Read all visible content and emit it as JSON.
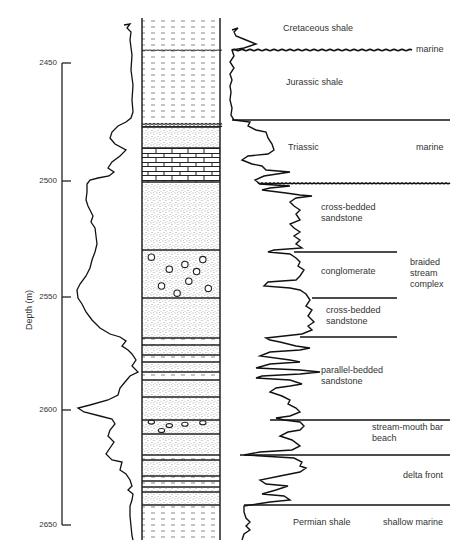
{
  "figure": {
    "axis": {
      "title": "Depth (m)",
      "ticks": [
        {
          "label": "2450",
          "y": 63
        },
        {
          "label": "2500",
          "y": 181
        },
        {
          "label": "2550",
          "y": 297
        },
        {
          "label": "2600",
          "y": 410
        },
        {
          "label": "2650",
          "y": 525
        }
      ]
    },
    "lithology_column": {
      "layers": [
        {
          "top": 18,
          "bottom": 50,
          "pattern": "shale"
        },
        {
          "top": 50,
          "bottom": 122,
          "pattern": "shale"
        },
        {
          "top": 122,
          "bottom": 127,
          "pattern": "wavy"
        },
        {
          "top": 127,
          "bottom": 148,
          "pattern": "sandstone"
        },
        {
          "top": 148,
          "bottom": 182,
          "pattern": "limestone"
        },
        {
          "top": 182,
          "bottom": 250,
          "pattern": "sandstone"
        },
        {
          "top": 250,
          "bottom": 298,
          "pattern": "conglomerate"
        },
        {
          "top": 298,
          "bottom": 338,
          "pattern": "sandstone"
        },
        {
          "top": 338,
          "bottom": 345,
          "pattern": "shale"
        },
        {
          "top": 345,
          "bottom": 355,
          "pattern": "sandstone"
        },
        {
          "top": 355,
          "bottom": 362,
          "pattern": "shale"
        },
        {
          "top": 362,
          "bottom": 372,
          "pattern": "sandstone"
        },
        {
          "top": 372,
          "bottom": 380,
          "pattern": "shale"
        },
        {
          "top": 380,
          "bottom": 397,
          "pattern": "sandstone"
        },
        {
          "top": 397,
          "bottom": 420,
          "pattern": "sandstone"
        },
        {
          "top": 420,
          "bottom": 434,
          "pattern": "conglomerate"
        },
        {
          "top": 434,
          "bottom": 455,
          "pattern": "sandstone"
        },
        {
          "top": 455,
          "bottom": 460,
          "pattern": "shale"
        },
        {
          "top": 460,
          "bottom": 476,
          "pattern": "sandstone"
        },
        {
          "top": 476,
          "bottom": 481,
          "pattern": "shale"
        },
        {
          "top": 481,
          "bottom": 487,
          "pattern": "shale"
        },
        {
          "top": 487,
          "bottom": 492,
          "pattern": "sandstone"
        },
        {
          "top": 492,
          "bottom": 505,
          "pattern": "sandstone"
        },
        {
          "top": 505,
          "bottom": 540,
          "pattern": "shale"
        }
      ]
    },
    "units": [
      {
        "name": "Cretaceous shale",
        "x": 283,
        "y": 28
      },
      {
        "name": "Jurassic shale",
        "x": 286,
        "y": 82
      },
      {
        "name": "Triassic",
        "x": 288,
        "y": 147
      },
      {
        "name": "cross-bedded sandstone",
        "x": 321,
        "y": 207,
        "lines": [
          "cross-bedded",
          "sandstone"
        ]
      },
      {
        "name": "conglomerate",
        "x": 321,
        "y": 271
      },
      {
        "name": "cross-bedded sandstone",
        "x": 326,
        "y": 310,
        "lines": [
          "cross-bedded",
          "sandstone"
        ]
      },
      {
        "name": "parallel-bedded sandstone",
        "x": 321,
        "y": 370,
        "lines": [
          "parallel-bedded",
          "sandstone"
        ]
      },
      {
        "name": "stream-mouth bar beach",
        "x": 372,
        "y": 427,
        "lines": [
          "stream-mouth bar",
          "beach"
        ]
      },
      {
        "name": "delta front",
        "x": 403,
        "y": 475
      },
      {
        "name": "Permian shale",
        "x": 293,
        "y": 522
      }
    ],
    "environments": [
      {
        "label": "marine",
        "x": 416,
        "y": 49
      },
      {
        "label": "marine",
        "x": 416,
        "y": 147
      },
      {
        "label": "braided stream complex",
        "x": 410,
        "y": 262,
        "lines": [
          "braided",
          "stream",
          "complex"
        ]
      },
      {
        "label": "shallow marine",
        "x": 383,
        "y": 522
      }
    ],
    "boundaries": [
      {
        "y": 50,
        "x1": 232,
        "x2": 410,
        "style": "wavy"
      },
      {
        "y": 120,
        "x1": 232,
        "x2": 450,
        "style": "straight"
      },
      {
        "y": 183,
        "x1": 258,
        "x2": 450,
        "style": "wavy"
      },
      {
        "y": 252,
        "x1": 294,
        "x2": 397,
        "style": "straight"
      },
      {
        "y": 298,
        "x1": 312,
        "x2": 397,
        "style": "straight"
      },
      {
        "y": 337,
        "x1": 300,
        "x2": 397,
        "style": "straight"
      },
      {
        "y": 420,
        "x1": 270,
        "x2": 450,
        "style": "straight"
      },
      {
        "y": 455,
        "x1": 240,
        "x2": 450,
        "style": "straight"
      },
      {
        "y": 505,
        "x1": 244,
        "x2": 450,
        "style": "straight"
      }
    ]
  }
}
